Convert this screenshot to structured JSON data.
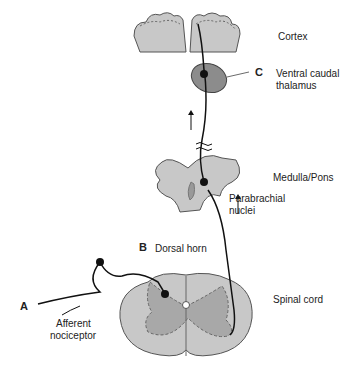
{
  "diagram": {
    "labels": {
      "cortex": "Cortex",
      "thalamus_line1": "Ventral caudal",
      "thalamus_line2": "thalamus",
      "thalamus_marker": "C",
      "medulla": "Medulla/Pons",
      "parabrachial_line1": "Parabrachial",
      "parabrachial_line2": "nuclei",
      "dorsal_horn_marker": "B",
      "dorsal_horn": "Dorsal horn",
      "spinal_cord": "Spinal cord",
      "afferent_marker": "A",
      "afferent_line1": "Afferent",
      "afferent_line2": "nociceptor"
    },
    "colors": {
      "tissue": "#c8c8c8",
      "grey_matter": "#a8a8a8",
      "thalamus": "#8c8c8c",
      "outline": "#555555",
      "neuron": "#111111"
    }
  }
}
